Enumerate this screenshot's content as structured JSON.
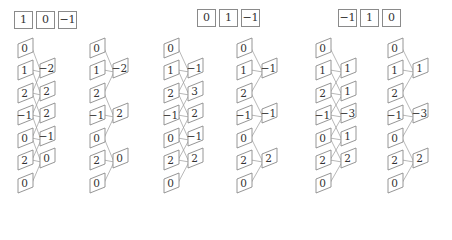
{
  "input": [
    0,
    1,
    2,
    -1,
    0,
    2,
    0
  ],
  "groups": [
    {
      "kernel": [
        "1",
        "0",
        "−1"
      ],
      "kernel_pos": {
        "x": 14,
        "y": 11
      },
      "full": {
        "col_x": 18,
        "out_x": 40,
        "outputs": [
          "−2",
          "2",
          "2",
          "−1",
          "0"
        ]
      },
      "strided": {
        "col_x": 90,
        "out_x": 113,
        "outputs": [
          "−2",
          "2",
          "0"
        ]
      }
    },
    {
      "kernel": [
        "0",
        "1",
        "−1"
      ],
      "kernel_pos": {
        "x": 197,
        "y": 9
      },
      "full": {
        "col_x": 164,
        "out_x": 188,
        "outputs": [
          "−1",
          "3",
          "2",
          "−1",
          "2"
        ]
      },
      "strided": {
        "col_x": 237,
        "out_x": 262,
        "outputs": [
          "−1",
          "−1",
          "2"
        ]
      }
    },
    {
      "kernel": [
        "−1",
        "1",
        "0"
      ],
      "kernel_pos": {
        "x": 338,
        "y": 9
      },
      "full": {
        "col_x": 316,
        "out_x": 341,
        "outputs": [
          "1",
          "1",
          "−3",
          "1",
          "2"
        ]
      },
      "strided": {
        "col_x": 388,
        "out_x": 413,
        "outputs": [
          "1",
          "−3",
          "2"
        ]
      }
    }
  ],
  "input_labels": [
    "0",
    "1",
    "2",
    "−1",
    "0",
    "2",
    "0"
  ],
  "colors": {
    "stroke": "#8a8a8a",
    "text": "#333333",
    "line": "#9a9a9a"
  }
}
